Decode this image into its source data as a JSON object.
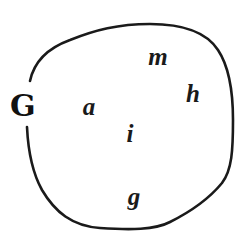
{
  "diagram": {
    "type": "set-diagram",
    "set": {
      "label": "G",
      "boundary_color": "#1a1a1a"
    },
    "elements": [
      {
        "label": "a"
      },
      {
        "label": "m"
      },
      {
        "label": "h"
      },
      {
        "label": "i"
      },
      {
        "label": "g"
      }
    ]
  }
}
